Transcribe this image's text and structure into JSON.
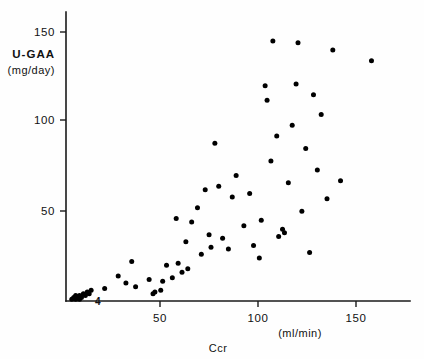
{
  "chart_data": {
    "type": "scatter",
    "title": "",
    "xlabel": "Ccr",
    "xunit": "(ml/min)",
    "ylabel": "U-GAA",
    "yunit": "(mg/day)",
    "xlim": [
      0,
      183
    ],
    "ylim": [
      0,
      157
    ],
    "xticks": [
      50,
      100,
      150
    ],
    "xtick_labels": [
      "50",
      "100",
      "150"
    ],
    "yticks": [
      50,
      100,
      150
    ],
    "ytick_labels": [
      "50",
      "100",
      "150"
    ],
    "grid": false,
    "legend": null,
    "annotations": [
      {
        "text": "4",
        "x": 14,
        "y": 3,
        "note": "overlap count for dense cluster near origin"
      }
    ],
    "series": [
      {
        "name": "patients",
        "marker": "filled-circle",
        "color": "#000000",
        "points": [
          [
            3,
            1
          ],
          [
            4,
            2
          ],
          [
            5,
            1
          ],
          [
            5,
            3
          ],
          [
            6,
            2
          ],
          [
            7,
            1
          ],
          [
            7,
            3
          ],
          [
            8,
            2
          ],
          [
            9,
            4
          ],
          [
            10,
            3
          ],
          [
            11,
            5
          ],
          [
            12,
            4
          ],
          [
            13,
            6
          ],
          [
            20,
            7
          ],
          [
            27,
            14
          ],
          [
            31,
            10
          ],
          [
            34,
            22
          ],
          [
            36,
            8
          ],
          [
            43,
            12
          ],
          [
            45,
            4
          ],
          [
            46,
            5
          ],
          [
            49,
            6
          ],
          [
            50,
            11
          ],
          [
            52,
            20
          ],
          [
            55,
            13
          ],
          [
            57,
            46
          ],
          [
            58,
            21
          ],
          [
            60,
            16
          ],
          [
            62,
            33
          ],
          [
            63,
            18
          ],
          [
            65,
            44
          ],
          [
            68,
            52
          ],
          [
            70,
            26
          ],
          [
            72,
            62
          ],
          [
            74,
            37
          ],
          [
            75,
            30
          ],
          [
            77,
            88
          ],
          [
            79,
            64
          ],
          [
            81,
            35
          ],
          [
            84,
            29
          ],
          [
            86,
            58
          ],
          [
            88,
            70
          ],
          [
            92,
            42
          ],
          [
            95,
            60
          ],
          [
            97,
            31
          ],
          [
            100,
            24
          ],
          [
            101,
            45
          ],
          [
            103,
            120
          ],
          [
            104,
            112
          ],
          [
            106,
            78
          ],
          [
            107,
            145
          ],
          [
            109,
            92
          ],
          [
            110,
            36
          ],
          [
            112,
            40
          ],
          [
            113,
            38
          ],
          [
            115,
            66
          ],
          [
            117,
            98
          ],
          [
            119,
            121
          ],
          [
            120,
            144
          ],
          [
            122,
            50
          ],
          [
            124,
            85
          ],
          [
            126,
            27
          ],
          [
            128,
            115
          ],
          [
            130,
            73
          ],
          [
            132,
            104
          ],
          [
            135,
            57
          ],
          [
            138,
            140
          ],
          [
            142,
            67
          ],
          [
            158,
            134
          ]
        ]
      }
    ]
  },
  "axis": {
    "x_tick_0": "50",
    "x_tick_1": "100",
    "x_tick_2": "150",
    "y_tick_0": "50",
    "y_tick_1": "100",
    "y_tick_2": "150",
    "x_title": "Ccr",
    "x_unit": "(ml/min)",
    "y_title": "U-GAA",
    "y_unit": "(mg/day)",
    "cluster_note": "4"
  }
}
